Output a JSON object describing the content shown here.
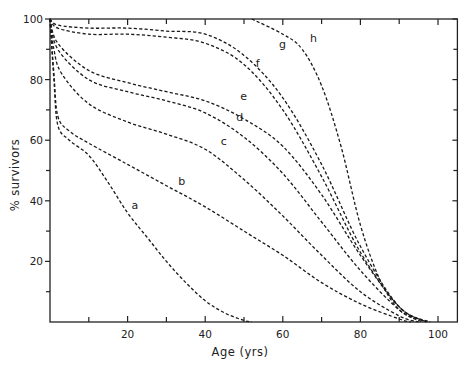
{
  "chart_data": {
    "type": "line",
    "title": "",
    "xlabel": "Age (yrs)",
    "ylabel": "% survivors",
    "xlim": [
      0,
      105
    ],
    "ylim": [
      0,
      100
    ],
    "x_ticks": [
      20,
      40,
      60,
      80,
      100
    ],
    "x_minor_ticks": [
      10,
      30,
      50,
      70,
      90
    ],
    "y_ticks": [
      20,
      40,
      60,
      80,
      100
    ],
    "y_minor_ticks": [
      10,
      30,
      50,
      70,
      90
    ],
    "grid": false,
    "legend": "inline curve labels",
    "line_style": "dashed",
    "series": [
      {
        "name": "a",
        "label_pos": [
          20,
          36
        ],
        "x": [
          0,
          1,
          2,
          5,
          10,
          15,
          20,
          25,
          30,
          35,
          40,
          45,
          50,
          52
        ],
        "y": [
          100,
          80,
          65,
          60,
          55,
          46,
          36,
          28,
          20,
          13,
          7,
          3,
          0.5,
          0
        ]
      },
      {
        "name": "b",
        "label_pos": [
          32,
          44
        ],
        "x": [
          0,
          1,
          2,
          5,
          10,
          20,
          30,
          40,
          50,
          60,
          70,
          80,
          90,
          93
        ],
        "y": [
          100,
          82,
          68,
          63,
          59,
          52,
          45,
          38,
          30,
          22,
          13,
          6,
          1,
          0
        ]
      },
      {
        "name": "c",
        "label_pos": [
          43,
          57
        ],
        "x": [
          0,
          1,
          3,
          10,
          20,
          30,
          40,
          50,
          60,
          70,
          80,
          90,
          95
        ],
        "y": [
          100,
          90,
          82,
          72,
          66,
          62,
          57,
          47,
          35,
          22,
          10,
          2,
          0
        ]
      },
      {
        "name": "d",
        "label_pos": [
          47,
          65
        ],
        "x": [
          0,
          2,
          10,
          20,
          30,
          40,
          50,
          60,
          70,
          80,
          90,
          96
        ],
        "y": [
          100,
          90,
          80,
          76,
          73,
          69,
          61,
          49,
          33,
          17,
          4,
          0
        ]
      },
      {
        "name": "e",
        "label_pos": [
          48,
          72
        ],
        "x": [
          0,
          2,
          10,
          20,
          30,
          40,
          50,
          60,
          70,
          80,
          90,
          97
        ],
        "y": [
          100,
          92,
          83,
          79,
          76,
          73,
          67,
          58,
          42,
          22,
          5,
          0
        ]
      },
      {
        "name": "f",
        "label_pos": [
          52,
          83
        ],
        "x": [
          0,
          2,
          10,
          20,
          30,
          40,
          50,
          60,
          70,
          80,
          90,
          97
        ],
        "y": [
          100,
          97,
          95,
          95,
          94,
          92,
          85,
          70,
          48,
          23,
          5,
          0
        ]
      },
      {
        "name": "g",
        "label_pos": [
          58,
          89
        ],
        "x": [
          0,
          2,
          10,
          20,
          30,
          40,
          50,
          60,
          70,
          80,
          90,
          98
        ],
        "y": [
          100,
          98,
          97,
          97,
          96,
          95,
          88,
          74,
          52,
          25,
          5,
          0
        ]
      },
      {
        "name": "h",
        "label_pos": [
          66,
          91
        ],
        "x": [
          52,
          60,
          65,
          70,
          75,
          80,
          85,
          90,
          95,
          98
        ],
        "y": [
          100,
          95,
          90,
          78,
          58,
          32,
          14,
          4,
          1,
          0
        ]
      }
    ]
  }
}
